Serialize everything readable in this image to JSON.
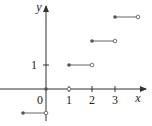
{
  "chart_data": {
    "type": "line",
    "title": "",
    "xlabel": "x",
    "ylabel": "y",
    "x_ticks": [
      "1",
      "2",
      "3"
    ],
    "y_ticks": [
      "1"
    ],
    "origin_label": "0",
    "xlim": [
      -1.9,
      4.5
    ],
    "ylim": [
      -1.5,
      3.7
    ],
    "grid": false,
    "segments": [
      {
        "x_start": -1,
        "x_end": 0,
        "y": -1,
        "left_closed": true,
        "right_open": true
      },
      {
        "x_start": 0,
        "x_end": 1,
        "y": 0,
        "left_closed": true,
        "right_open": true
      },
      {
        "x_start": 1,
        "x_end": 2,
        "y": 1,
        "left_closed": true,
        "right_open": true
      },
      {
        "x_start": 2,
        "x_end": 3,
        "y": 2,
        "left_closed": true,
        "right_open": true
      },
      {
        "x_start": 3,
        "x_end": 4,
        "y": 3,
        "left_closed": true,
        "right_open": true
      }
    ],
    "colors": {
      "axis": "#333333",
      "segment": "#666666",
      "dot": "#555555"
    }
  }
}
